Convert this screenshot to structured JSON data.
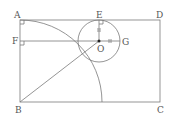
{
  "diagram": {
    "type": "geometry",
    "labels": {
      "A": "A",
      "B": "B",
      "C": "C",
      "D": "D",
      "E": "E",
      "F": "F",
      "G": "G",
      "O": "O"
    },
    "points": {
      "A": [
        20,
        20
      ],
      "B": [
        20,
        102
      ],
      "C": [
        160,
        102
      ],
      "D": [
        160,
        20
      ],
      "E": [
        99,
        20
      ],
      "F": [
        20,
        41
      ],
      "G": [
        119,
        41
      ],
      "O": [
        99,
        41
      ]
    },
    "shapes": [
      {
        "kind": "rectangle",
        "vertices": [
          "A",
          "D",
          "C",
          "B"
        ]
      },
      {
        "kind": "circle",
        "center": "O",
        "radius": 21,
        "style": "dashed-lower"
      },
      {
        "kind": "arc",
        "center": "B",
        "from": "A",
        "radius": 82
      },
      {
        "kind": "segment",
        "from": "F",
        "to": "G"
      },
      {
        "kind": "segment",
        "from": "B",
        "to": "O"
      },
      {
        "kind": "segment",
        "from": "E",
        "to": "O"
      }
    ],
    "right_angles": [
      "A",
      "F",
      "E"
    ],
    "colors": {
      "stroke": "#777777",
      "label": "#555555"
    }
  }
}
